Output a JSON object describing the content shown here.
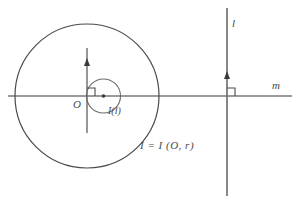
{
  "figure": {
    "background_color": "#ffffff",
    "stroke_color": "#4a4a4a",
    "axis_color": "#9a9a9a",
    "labels": {
      "origin": "O",
      "image_of_line": "I(l)",
      "line_l": "l",
      "line_m": "m",
      "equation": "I =  I (O, r)"
    },
    "elements": {
      "outer_circle": {
        "name": "I",
        "cx": 87,
        "cy": 96,
        "r": 72
      },
      "inner_circle": {
        "name": "I(l)",
        "cx": 103.5,
        "cy": 96,
        "r": 17
      },
      "line_m": {
        "orientation": "horizontal",
        "y": 96,
        "x1": 8,
        "x2": 292
      },
      "line_l": {
        "orientation": "vertical",
        "x": 227,
        "y1": 8,
        "y2": 196
      },
      "axis_short_vertical": {
        "x": 87,
        "y1": 48,
        "y2": 133
      },
      "center_dot": {
        "cx": 103.5,
        "cy": 96
      },
      "right_angle_origin": {
        "x": 87,
        "y": 96
      },
      "right_angle_line_l": {
        "x": 227,
        "y": 96
      },
      "arrow_origin": {
        "x": 87,
        "y": 62
      },
      "arrow_line_l": {
        "x": 227,
        "y": 75
      }
    }
  }
}
